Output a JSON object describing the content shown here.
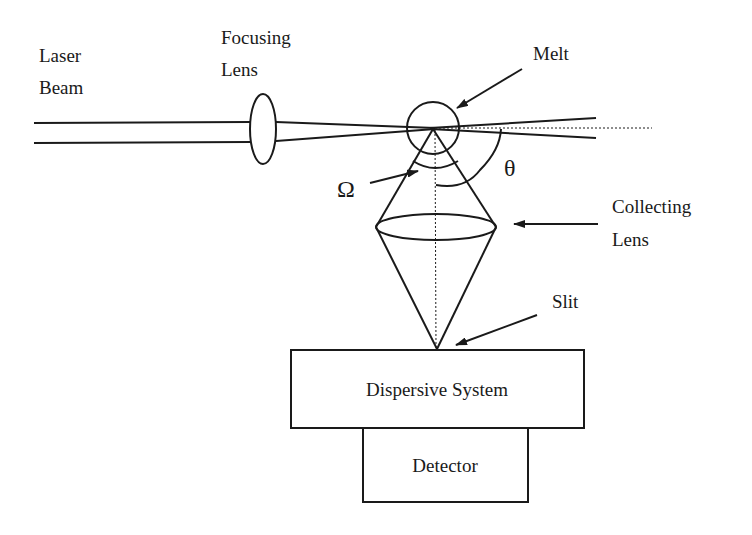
{
  "diagram": {
    "labels": {
      "laser_beam_line1": "Laser",
      "laser_beam_line2": "Beam",
      "focusing_lens_line1": "Focusing",
      "focusing_lens_line2": "Lens",
      "melt": "Melt",
      "omega": "Ω",
      "theta": "θ",
      "collecting_lens_line1": "Collecting",
      "collecting_lens_line2": "Lens",
      "slit": "Slit",
      "dispersive_system": "Dispersive System",
      "detector": "Detector"
    },
    "colors": {
      "line": "#1a1a1a",
      "background": "#ffffff"
    }
  }
}
